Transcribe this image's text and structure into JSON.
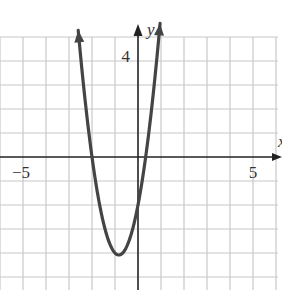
{
  "chart_data": {
    "type": "line",
    "title": "",
    "function": "y = 3x^2 + 5x - 2",
    "xlabel": "x",
    "ylabel": "y",
    "xlim": [
      -6,
      6.2
    ],
    "ylim": [
      -5.5,
      5.5
    ],
    "grid": true,
    "tick_labels": {
      "x": [
        {
          "value": -5,
          "label": "−5"
        },
        {
          "value": 5,
          "label": "5"
        }
      ],
      "y": [
        {
          "value": 4,
          "label": "4"
        }
      ]
    },
    "series": [
      {
        "name": "parabola",
        "color": "#444444",
        "x_range": [
          -2.6,
          0.96
        ],
        "vertex": [
          -0.83,
          -4.08
        ],
        "x_intercepts": [
          -2,
          0.33
        ],
        "y_intercept": -2,
        "arrows_at_ends": true
      }
    ]
  },
  "layout": {
    "origin_px": [
      138,
      157
    ],
    "unit_x_px": 23,
    "unit_y_px": 24,
    "grid_color": "#c8c8c8",
    "axis_color": "#222222",
    "curve_color": "#444444"
  }
}
